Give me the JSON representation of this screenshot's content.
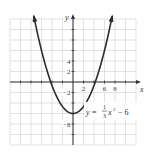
{
  "chart_data": {
    "type": "line",
    "title": "",
    "equation": "y = (1/3)x^2 - 6",
    "equation_display": {
      "prefix": "y =",
      "frac_num": "1",
      "frac_den": "3",
      "suffix": "x",
      "exp": "2",
      "tail": "− 6"
    },
    "xlabel": "x",
    "ylabel": "y",
    "xlim": [
      -12,
      12
    ],
    "ylim": [
      -12,
      12
    ],
    "grid": true,
    "grid_step": 2,
    "x_tick_labels": [
      {
        "value": 2,
        "label": "2"
      },
      {
        "value": 6,
        "label": "6"
      },
      {
        "value": 8,
        "label": "8"
      }
    ],
    "y_tick_labels": [
      {
        "value": 4,
        "label": "4"
      },
      {
        "value": 2,
        "label": "2"
      },
      {
        "value": -2,
        "label": "−2"
      },
      {
        "value": -8,
        "label": "−8"
      }
    ],
    "series": [
      {
        "name": "y = (1/3)x^2 - 6",
        "x": [
          -10.5,
          -9,
          -8,
          -6,
          -4.24,
          -4,
          -2,
          0,
          2,
          4,
          4.24,
          6,
          8,
          9,
          10.5
        ],
        "y": [
          30.75,
          21,
          15.33,
          6,
          0,
          -0.67,
          -4.67,
          -6,
          -4.67,
          -0.67,
          0,
          6,
          15.33,
          21,
          30.75
        ],
        "vertex": [
          0,
          -6
        ],
        "x_intercepts": [
          -4.24,
          4.24
        ],
        "arrows_at_ends": true
      }
    ],
    "colors": {
      "curve": "#2a2a2a",
      "grid": "#cfcfcf",
      "axis": "#333333"
    }
  }
}
